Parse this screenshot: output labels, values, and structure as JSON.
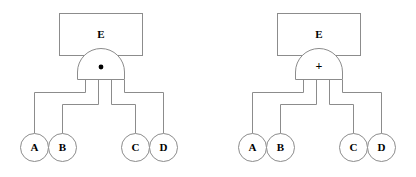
{
  "figure": {
    "background_color": "#ffffff",
    "line_color": "#8c8c8c",
    "text_color": "#000000",
    "diagram_count": 2
  },
  "diagrams": [
    {
      "id": "left-diagram",
      "top_event": {
        "label": "E",
        "shape": "rectangle"
      },
      "gate": {
        "label": "·",
        "symbol_name": "and-gate-dot",
        "type": "AND",
        "shape": "dome"
      },
      "inputs": [
        {
          "label": "A",
          "shape": "circle"
        },
        {
          "label": "B",
          "shape": "circle"
        },
        {
          "label": "C",
          "shape": "circle"
        },
        {
          "label": "D",
          "shape": "circle"
        }
      ]
    },
    {
      "id": "right-diagram",
      "top_event": {
        "label": "E",
        "shape": "rectangle"
      },
      "gate": {
        "label": "+",
        "symbol_name": "or-gate-plus",
        "type": "OR",
        "shape": "dome"
      },
      "inputs": [
        {
          "label": "A",
          "shape": "circle"
        },
        {
          "label": "B",
          "shape": "circle"
        },
        {
          "label": "C",
          "shape": "circle"
        },
        {
          "label": "D",
          "shape": "circle"
        }
      ]
    }
  ]
}
